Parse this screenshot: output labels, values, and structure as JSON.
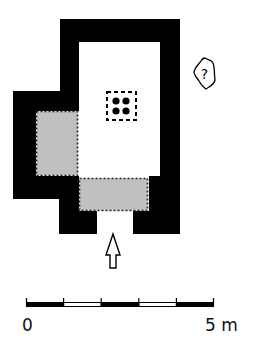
{
  "diagram": {
    "type": "architectural-floor-plan",
    "colors": {
      "wall": "#000000",
      "floor": "#ffffff",
      "shaded_area": "#c0c0c0",
      "dash": "#222222"
    },
    "symbols": {
      "unknown_marker": "?",
      "entrance_arrow": "up-arrow",
      "pillar_grid": "4 dots in dashed square"
    },
    "scale_bar": {
      "start_label": "0",
      "end_label": "5 m",
      "segments": 5
    }
  }
}
